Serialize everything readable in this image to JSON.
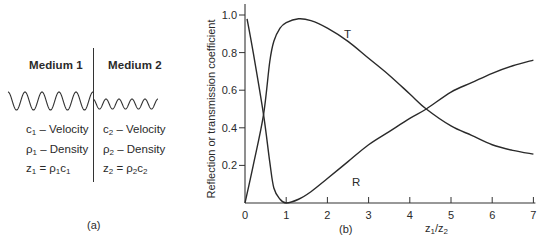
{
  "panel_a": {
    "label": "(a)",
    "medium1": {
      "title": "Medium 1",
      "velocity": {
        "sym": "c",
        "sub": "1",
        "text": " – Velocity"
      },
      "density": {
        "sym": "ρ",
        "sub": "1",
        "text": " – Density"
      },
      "impedance": {
        "lhs": "z",
        "lhs_sub": "1",
        "eq": " = ",
        "r1": "ρ",
        "r1_sub": "1",
        "r2": "c",
        "r2_sub": "1"
      }
    },
    "medium2": {
      "title": "Medium 2",
      "velocity": {
        "sym": "c",
        "sub": "2",
        "text": " – Velocity"
      },
      "density": {
        "sym": "ρ",
        "sub": "2",
        "text": " – Density"
      },
      "impedance": {
        "lhs": "z",
        "lhs_sub": "2",
        "eq": " = ",
        "r1": "ρ",
        "r1_sub": "2",
        "r2": "c",
        "r2_sub": "2"
      }
    }
  },
  "panel_b": {
    "label": "(b)",
    "xlabel": {
      "a": "z",
      "a_sub": "1",
      "slash": "/",
      "b": "z",
      "b_sub": "2"
    }
  },
  "chart_data": {
    "type": "line",
    "title": "",
    "xlabel": "z1/z2",
    "ylabel": "Reflection or transmission coefficient",
    "xlim": [
      0,
      7
    ],
    "ylim": [
      0,
      1.0
    ],
    "x_ticks": [
      "0",
      "1",
      "2",
      "3",
      "4",
      "5",
      "6",
      "7"
    ],
    "y_ticks": [
      "0.2",
      "0.4",
      "0.6",
      "0.8",
      "1.0"
    ],
    "grid": false,
    "legend": "none (curves labelled inline)",
    "series": [
      {
        "name": "R",
        "label_pos": [
          2.6,
          0.11
        ],
        "points": [
          [
            0.05,
            0.98
          ],
          [
            0.2,
            0.8
          ],
          [
            0.45,
            0.47
          ],
          [
            0.6,
            0.22
          ],
          [
            0.7,
            0.08
          ],
          [
            0.85,
            0.02
          ],
          [
            1.0,
            0.0
          ],
          [
            1.3,
            0.02
          ],
          [
            1.6,
            0.06
          ],
          [
            2.0,
            0.13
          ],
          [
            2.5,
            0.22
          ],
          [
            3.0,
            0.31
          ],
          [
            3.5,
            0.38
          ],
          [
            4.0,
            0.45
          ],
          [
            4.4,
            0.5
          ],
          [
            5.0,
            0.59
          ],
          [
            5.5,
            0.64
          ],
          [
            6.0,
            0.69
          ],
          [
            6.5,
            0.73
          ],
          [
            7.0,
            0.76
          ]
        ]
      },
      {
        "name": "T",
        "label_pos": [
          2.4,
          0.9
        ],
        "points": [
          [
            0.0,
            0.0
          ],
          [
            0.2,
            0.2
          ],
          [
            0.45,
            0.47
          ],
          [
            0.6,
            0.75
          ],
          [
            0.7,
            0.86
          ],
          [
            0.85,
            0.93
          ],
          [
            1.0,
            0.96
          ],
          [
            1.3,
            0.98
          ],
          [
            1.6,
            0.97
          ],
          [
            2.0,
            0.93
          ],
          [
            2.5,
            0.86
          ],
          [
            3.0,
            0.77
          ],
          [
            3.5,
            0.68
          ],
          [
            4.0,
            0.58
          ],
          [
            4.4,
            0.5
          ],
          [
            5.0,
            0.41
          ],
          [
            5.5,
            0.36
          ],
          [
            6.0,
            0.31
          ],
          [
            6.5,
            0.28
          ],
          [
            7.0,
            0.26
          ]
        ]
      }
    ],
    "intersections": [
      [
        0.45,
        0.47
      ],
      [
        4.4,
        0.5
      ]
    ]
  }
}
